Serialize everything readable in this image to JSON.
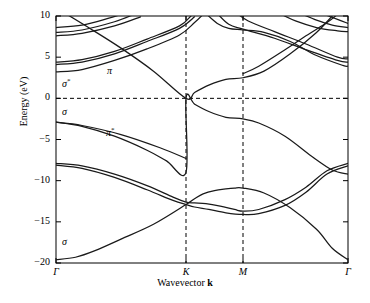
{
  "chart_data": {
    "type": "line",
    "title": "",
    "xlabel": "Wavevector k",
    "ylabel": "Energy (eV)",
    "ylim": [
      -20,
      10
    ],
    "yticks": [
      10,
      5,
      0,
      -5,
      -10,
      -15,
      -20
    ],
    "ytick_labels": [
      "10",
      "5",
      "0",
      "−5",
      "−10",
      "−15",
      "−20"
    ],
    "xticks": [
      0,
      1,
      2,
      3
    ],
    "xtick_labels": [
      "Γ",
      "K",
      "M",
      "Γ"
    ],
    "xtick_positions_px": [
      56,
      186,
      243,
      348
    ],
    "grid": false,
    "guides": {
      "horizontal_dashed": [
        0
      ],
      "vertical_dashed": [
        "K",
        "M"
      ]
    },
    "legend_position": "none",
    "annotations": [
      {
        "text": "σ*",
        "x_px": 62,
        "y_px": 84,
        "energy_ev": 1.7,
        "label": "sigma-star"
      },
      {
        "text": "σ",
        "x_px": 62,
        "y_px": 113,
        "energy_ev": -2.0,
        "label": "sigma"
      },
      {
        "text": "π",
        "x_px": 107,
        "y_px": 72,
        "energy_ev": 3.1,
        "label": "pi"
      },
      {
        "text": "π*",
        "x_px": 106,
        "y_px": 133,
        "energy_ev": -4.5,
        "label": "pi-star"
      },
      {
        "text": "σ",
        "x_px": 62,
        "y_px": 243,
        "energy_ev": -17.6,
        "label": "sigma-lower"
      }
    ],
    "series": [
      {
        "name": "sigma-1 (valence lowest)",
        "points": [
          [
            0,
            -19.6
          ],
          [
            0.15,
            -19.3
          ],
          [
            0.3,
            -18.5
          ],
          [
            0.5,
            -17.1
          ],
          [
            0.75,
            -15.3
          ],
          [
            1.0,
            -12.9
          ],
          [
            1.15,
            -12.2
          ],
          [
            1.3,
            -11.6
          ],
          [
            1.5,
            -11.2
          ],
          [
            1.7,
            -11.0
          ],
          [
            1.85,
            -10.9
          ],
          [
            2.0,
            -10.9
          ],
          [
            2.2,
            -11.5
          ],
          [
            2.45,
            -13.3
          ],
          [
            2.7,
            -15.9
          ],
          [
            2.85,
            -18.2
          ],
          [
            3.0,
            -19.6
          ]
        ]
      },
      {
        "name": "sigma-2 (valence)",
        "points": [
          [
            0,
            -7.9
          ],
          [
            0.2,
            -8.2
          ],
          [
            0.45,
            -9.2
          ],
          [
            0.7,
            -10.6
          ],
          [
            0.9,
            -12.0
          ],
          [
            1.0,
            -12.6
          ],
          [
            1.15,
            -12.7
          ],
          [
            1.35,
            -12.8
          ],
          [
            1.6,
            -13.1
          ],
          [
            1.85,
            -13.5
          ],
          [
            2.0,
            -13.7
          ],
          [
            2.15,
            -13.5
          ],
          [
            2.4,
            -12.3
          ],
          [
            2.6,
            -10.8
          ],
          [
            2.8,
            -8.8
          ],
          [
            3.0,
            -7.9
          ]
        ]
      },
      {
        "name": "sigma-3 (valence)",
        "points": [
          [
            0,
            -8.1
          ],
          [
            0.2,
            -8.5
          ],
          [
            0.45,
            -9.6
          ],
          [
            0.7,
            -11.1
          ],
          [
            0.9,
            -12.4
          ],
          [
            1.0,
            -12.9
          ],
          [
            1.15,
            -13.2
          ],
          [
            1.4,
            -13.5
          ],
          [
            1.7,
            -13.9
          ],
          [
            2.0,
            -14.1
          ],
          [
            2.15,
            -14.0
          ],
          [
            2.4,
            -13.0
          ],
          [
            2.6,
            -11.4
          ],
          [
            2.8,
            -9.2
          ],
          [
            3.0,
            -8.2
          ]
        ]
      },
      {
        "name": "pi (valence, touches 0 at K)",
        "points": [
          [
            0,
            -2.9
          ],
          [
            0.2,
            -3.4
          ],
          [
            0.45,
            -4.6
          ],
          [
            0.7,
            -6.3
          ],
          [
            0.85,
            -7.6
          ],
          [
            1.0,
            -9.0
          ],
          [
            1.0,
            0.0
          ],
          [
            1.15,
            -0.7
          ],
          [
            1.4,
            -1.6
          ],
          [
            1.7,
            -2.3
          ],
          [
            2.0,
            -2.5
          ],
          [
            2.15,
            -3.0
          ],
          [
            2.4,
            -4.6
          ],
          [
            2.65,
            -7.0
          ],
          [
            2.85,
            -8.7
          ],
          [
            3.0,
            -9.2
          ]
        ]
      },
      {
        "name": "pi-lower-left (sigma bonding branch)",
        "points": [
          [
            0,
            -2.9
          ],
          [
            0.2,
            -3.3
          ],
          [
            0.5,
            -4.4
          ],
          [
            0.8,
            -6.0
          ],
          [
            1.0,
            -7.3
          ]
        ]
      },
      {
        "name": "pi* (conduction, from K up)",
        "points": [
          [
            0,
            11.0
          ],
          [
            0.25,
            8.6
          ],
          [
            0.5,
            6.1
          ],
          [
            0.75,
            3.3
          ],
          [
            1.0,
            0.0
          ],
          [
            1.15,
            0.7
          ],
          [
            1.4,
            1.6
          ],
          [
            1.7,
            2.3
          ],
          [
            2.0,
            2.5
          ],
          [
            2.2,
            3.3
          ],
          [
            2.45,
            5.4
          ],
          [
            2.7,
            8.0
          ],
          [
            2.85,
            10.0
          ]
        ]
      },
      {
        "name": "sigma*-1 (conduction)",
        "points": [
          [
            0,
            3.2
          ],
          [
            0.2,
            3.5
          ],
          [
            0.45,
            4.6
          ],
          [
            0.7,
            6.0
          ],
          [
            0.95,
            7.7
          ],
          [
            1.15,
            9.2
          ],
          [
            1.3,
            10.2
          ]
        ]
      },
      {
        "name": "sigma*-2 (conduction)",
        "points": [
          [
            0,
            4.1
          ],
          [
            0.2,
            4.4
          ],
          [
            0.45,
            5.4
          ],
          [
            0.7,
            6.9
          ],
          [
            0.95,
            8.5
          ],
          [
            1.15,
            9.9
          ]
        ]
      },
      {
        "name": "sigma*-3 (conduction)",
        "points": [
          [
            0,
            4.4
          ],
          [
            0.2,
            4.7
          ],
          [
            0.45,
            5.7
          ],
          [
            0.7,
            7.2
          ],
          [
            0.95,
            8.8
          ],
          [
            1.1,
            10.1
          ]
        ]
      },
      {
        "name": "upper-1",
        "points": [
          [
            0,
            7.6
          ],
          [
            0.2,
            7.9
          ],
          [
            0.45,
            8.8
          ],
          [
            0.65,
            9.9
          ]
        ]
      },
      {
        "name": "upper-2",
        "points": [
          [
            0,
            8.0
          ],
          [
            0.2,
            8.3
          ],
          [
            0.45,
            9.3
          ],
          [
            0.6,
            10.2
          ]
        ]
      },
      {
        "name": "upper-3",
        "points": [
          [
            0,
            8.6
          ],
          [
            0.2,
            8.9
          ],
          [
            0.4,
            9.7
          ],
          [
            0.52,
            10.3
          ]
        ]
      },
      {
        "name": "right-branch-1",
        "points": [
          [
            1.35,
            10.3
          ],
          [
            1.55,
            9.1
          ],
          [
            1.75,
            8.5
          ],
          [
            2.0,
            8.3
          ],
          [
            2.2,
            8.0
          ],
          [
            2.45,
            6.9
          ],
          [
            2.7,
            5.2
          ],
          [
            2.95,
            4.0
          ],
          [
            3.0,
            3.9
          ]
        ]
      },
      {
        "name": "right-branch-2",
        "points": [
          [
            1.55,
            10.3
          ],
          [
            1.75,
            9.0
          ],
          [
            2.0,
            8.4
          ],
          [
            2.3,
            7.3
          ],
          [
            2.6,
            5.9
          ],
          [
            2.9,
            4.6
          ],
          [
            3.0,
            4.4
          ]
        ]
      },
      {
        "name": "right-branch-3",
        "points": [
          [
            1.9,
            10.3
          ],
          [
            2.05,
            9.4
          ],
          [
            2.3,
            8.1
          ],
          [
            2.6,
            6.6
          ],
          [
            2.9,
            5.0
          ],
          [
            3.0,
            4.8
          ]
        ]
      },
      {
        "name": "right-cross-1",
        "points": [
          [
            2.0,
            3.0
          ],
          [
            2.15,
            3.9
          ],
          [
            2.4,
            5.9
          ],
          [
            2.6,
            7.6
          ],
          [
            2.8,
            9.2
          ],
          [
            2.9,
            10.2
          ]
        ]
      },
      {
        "name": "right-top-1",
        "points": [
          [
            2.35,
            10.3
          ],
          [
            2.5,
            9.4
          ],
          [
            2.7,
            8.6
          ],
          [
            2.9,
            8.2
          ],
          [
            3.0,
            8.1
          ]
        ]
      },
      {
        "name": "right-top-2",
        "points": [
          [
            2.55,
            10.3
          ],
          [
            2.7,
            9.5
          ],
          [
            2.85,
            8.9
          ],
          [
            3.0,
            8.6
          ]
        ]
      },
      {
        "name": "right-top-3",
        "points": [
          [
            2.75,
            10.3
          ],
          [
            2.9,
            9.6
          ],
          [
            3.0,
            9.1
          ]
        ]
      }
    ]
  },
  "axes": {
    "plot_left_px": 56,
    "plot_right_px": 348,
    "plot_top_px": 16,
    "plot_bottom_px": 263
  }
}
